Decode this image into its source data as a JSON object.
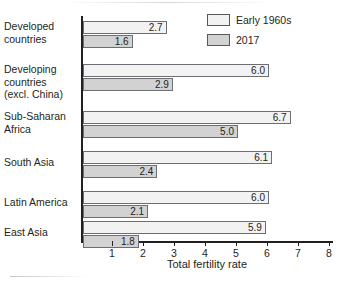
{
  "chart_data": {
    "type": "bar",
    "orientation": "horizontal",
    "title": "",
    "xlabel": "Total fertility rate",
    "ylabel": "",
    "xlim": [
      0,
      8.6
    ],
    "xticks": [
      1,
      2,
      3,
      4,
      5,
      6,
      7,
      8
    ],
    "grid": false,
    "legend_position": "top-right",
    "categories": [
      "Developed countries",
      "Developing countries (excl. China)",
      "Sub-Saharan Africa",
      "South Asia",
      "Latin America",
      "East Asia"
    ],
    "category_lines": [
      [
        "Developed",
        "countries"
      ],
      [
        "Developing",
        "countries",
        "(excl. China)"
      ],
      [
        "Sub-Saharan",
        "Africa"
      ],
      [
        "South Asia"
      ],
      [
        "Latin America"
      ],
      [
        "East Asia"
      ]
    ],
    "series": [
      {
        "name": "Early 1960s",
        "color": "#f2f2f2",
        "values": [
          2.7,
          6.0,
          6.7,
          6.1,
          6.0,
          5.9
        ],
        "labels": [
          "2.7",
          "6.0",
          "6.7",
          "6.1",
          "6.0",
          "5.9"
        ]
      },
      {
        "name": "2017",
        "color": "#d2d2d2",
        "values": [
          1.6,
          2.9,
          5.0,
          2.4,
          2.1,
          1.8
        ],
        "labels": [
          "1.6",
          "2.9",
          "5.0",
          "2.4",
          "2.1",
          "1.8"
        ]
      }
    ]
  },
  "legend": {
    "items": [
      {
        "label": "Early 1960s",
        "swatch": "s-1960"
      },
      {
        "label": "2017",
        "swatch": "s-2017"
      }
    ]
  },
  "colors": {
    "axis": "#231f20",
    "bar_stroke": "#6d6e71",
    "series_1960s": "#f2f2f2",
    "series_2017": "#d2d2d2",
    "text": "#231f20",
    "background": "#ffffff"
  }
}
